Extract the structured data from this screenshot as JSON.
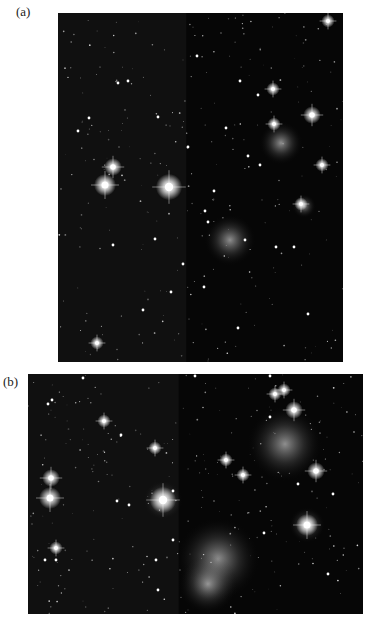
{
  "figure": {
    "panels": [
      {
        "label": "(a)",
        "content": "star-field-photograph",
        "stars": [
          [
            270,
            8,
            3
          ],
          [
            60,
            70,
            2
          ],
          [
            70,
            68,
            2
          ],
          [
            100,
            104,
            2
          ],
          [
            139,
            43,
            2
          ],
          [
            182,
            68,
            2
          ],
          [
            200,
            82,
            2
          ],
          [
            215,
            76,
            3
          ],
          [
            216,
            111,
            3
          ],
          [
            254,
            102,
            4
          ],
          [
            264,
            152,
            3
          ],
          [
            243,
            191,
            3
          ],
          [
            55,
            154,
            4
          ],
          [
            47,
            172,
            5
          ],
          [
            111,
            174,
            6
          ],
          [
            156,
            178,
            2
          ],
          [
            130,
            134,
            2
          ],
          [
            168,
            115,
            2
          ],
          [
            97,
            226,
            2
          ],
          [
            55,
            232,
            2
          ],
          [
            150,
            209,
            2
          ],
          [
            146,
            274,
            2
          ],
          [
            125,
            251,
            2
          ],
          [
            113,
            279,
            2
          ],
          [
            85,
            297,
            2
          ],
          [
            39,
            330,
            3
          ],
          [
            180,
            315,
            2
          ],
          [
            202,
            152,
            2
          ],
          [
            236,
            234,
            2
          ],
          [
            218,
            234,
            2
          ],
          [
            187,
            227,
            2
          ],
          [
            147,
            198,
            2
          ],
          [
            250,
            301,
            2
          ],
          [
            20,
            118,
            2
          ],
          [
            190,
            143,
            2
          ],
          [
            31,
            105,
            2
          ]
        ],
        "nebulae": [
          [
            223,
            130,
            22
          ],
          [
            172,
            227,
            26
          ],
          [
            111,
            174,
            14
          ],
          [
            246,
            193,
            12
          ],
          [
            47,
            172,
            12
          ]
        ]
      },
      {
        "label": "(b)",
        "content": "star-field-photograph-closeup",
        "stars": [
          [
            55,
            4,
            2
          ],
          [
            20,
            30,
            2
          ],
          [
            24,
            26,
            2
          ],
          [
            76,
            47,
            3
          ],
          [
            93,
            61,
            2
          ],
          [
            127,
            74,
            3
          ],
          [
            23,
            104,
            4
          ],
          [
            22,
            124,
            5
          ],
          [
            135,
            126,
            6
          ],
          [
            198,
            86,
            3
          ],
          [
            215,
            101,
            3
          ],
          [
            266,
            36,
            4
          ],
          [
            288,
            97,
            4
          ],
          [
            279,
            151,
            5
          ],
          [
            236,
            159,
            2
          ],
          [
            145,
            166,
            2
          ],
          [
            128,
            186,
            2
          ],
          [
            130,
            216,
            2
          ],
          [
            17,
            186,
            2
          ],
          [
            28,
            186,
            2
          ],
          [
            28,
            174,
            3
          ],
          [
            242,
            43,
            2
          ],
          [
            167,
            2,
            2
          ],
          [
            242,
            2,
            2
          ],
          [
            256,
            16,
            3
          ],
          [
            247,
            20,
            3
          ],
          [
            89,
            127,
            2
          ],
          [
            101,
            131,
            2
          ],
          [
            145,
            117,
            2
          ],
          [
            270,
            110,
            2
          ],
          [
            305,
            120,
            2
          ],
          [
            300,
            200,
            2
          ]
        ],
        "nebulae": [
          [
            257,
            70,
            38
          ],
          [
            190,
            185,
            42
          ],
          [
            135,
            126,
            20
          ],
          [
            279,
            151,
            18
          ],
          [
            180,
            210,
            30
          ]
        ]
      }
    ]
  }
}
